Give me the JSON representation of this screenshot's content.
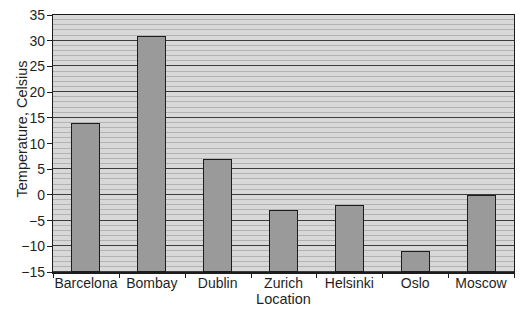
{
  "chart_data": {
    "type": "bar",
    "title": "",
    "categories": [
      "Barcelona",
      "Bombay",
      "Dublin",
      "Zurich",
      "Helsinki",
      "Oslo",
      "Moscow"
    ],
    "values": [
      14,
      31,
      7,
      -3,
      -2,
      -11,
      0
    ],
    "xlabel": "Location",
    "ylabel": "Temperature, Celsius",
    "ylim": [
      -15,
      35
    ],
    "ytick_step": 5,
    "yticks": [
      35,
      30,
      25,
      20,
      15,
      10,
      5,
      0,
      -5,
      -10,
      -15
    ],
    "ytick_labels": [
      "35",
      "30",
      "25",
      "20",
      "15",
      "10",
      "5",
      "0",
      "−15",
      "−10",
      "−5"
    ],
    "minor_grid_step": 1,
    "bar_baseline": -15,
    "grid_on": true,
    "legend": "none",
    "colors": {
      "page_bg": "#ffffff",
      "plot_bg": "#d8d8d8",
      "minor_gridline": "#b2b2b2",
      "major_gridline": "#3c3c3c",
      "bar_fill": "#9a9a9a",
      "bar_border": "#1c1c1c",
      "axis": "#1c1c1c",
      "text": "#1f1f1f"
    }
  }
}
